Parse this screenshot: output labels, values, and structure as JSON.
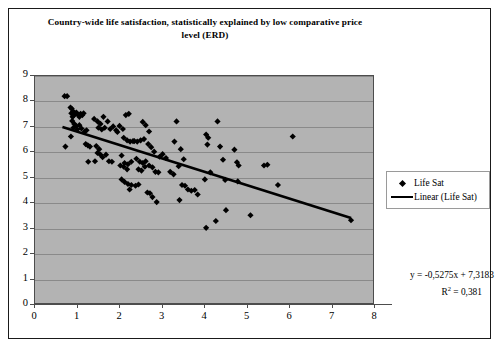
{
  "chart_data": {
    "type": "scatter",
    "title": "Country-wide life satisfaction, statistically explained by low comparative price level (ERD)",
    "xlabel": "",
    "ylabel": "",
    "xlim": [
      0,
      8
    ],
    "ylim": [
      0,
      9
    ],
    "x_ticks": [
      "0",
      "1",
      "2",
      "3",
      "4",
      "5",
      "6",
      "7",
      "8"
    ],
    "y_ticks": [
      "0",
      "1",
      "2",
      "3",
      "4",
      "5",
      "6",
      "7",
      "8",
      "9"
    ],
    "grid": "horizontal",
    "legend_position": "right",
    "plot_background": "#b3b3b3",
    "marker_color": "#000000",
    "trendline_color": "#000000",
    "legend": [
      {
        "label": "Life Sat",
        "key": "diamond-marker"
      },
      {
        "label": "Linear (Life Sat)",
        "key": "line-marker"
      }
    ],
    "annotations": {
      "equation": "y = -0,5275x + 7,3183",
      "r_squared_prefix": "R",
      "r_squared_exponent": "2",
      "r_squared_value": " = 0,381"
    },
    "trendline": {
      "slope": -0.5275,
      "intercept": 7.3183,
      "r_squared": 0.381,
      "x_start": 0.65,
      "x_end": 7.48
    },
    "series": [
      {
        "name": "Life Sat",
        "points": [
          [
            0.7,
            8.2
          ],
          [
            0.76,
            8.2
          ],
          [
            0.72,
            6.2
          ],
          [
            0.84,
            7.75
          ],
          [
            0.87,
            7.7
          ],
          [
            0.9,
            7.6
          ],
          [
            0.86,
            7.52
          ],
          [
            0.92,
            7.45
          ],
          [
            0.89,
            7.38
          ],
          [
            0.95,
            7.5
          ],
          [
            0.98,
            7.55
          ],
          [
            1.02,
            7.46
          ],
          [
            1.05,
            7.38
          ],
          [
            0.88,
            7.22
          ],
          [
            0.93,
            7.1
          ],
          [
            0.97,
            7.02
          ],
          [
            0.91,
            6.95
          ],
          [
            1.0,
            6.88
          ],
          [
            0.85,
            6.6
          ],
          [
            1.08,
            7.5
          ],
          [
            1.12,
            7.45
          ],
          [
            1.15,
            7.52
          ],
          [
            1.05,
            7.05
          ],
          [
            1.1,
            6.92
          ],
          [
            1.18,
            6.8
          ],
          [
            1.22,
            6.85
          ],
          [
            1.2,
            6.3
          ],
          [
            1.25,
            6.25
          ],
          [
            1.3,
            6.2
          ],
          [
            1.26,
            5.6
          ],
          [
            1.42,
            5.62
          ],
          [
            1.4,
            7.3
          ],
          [
            1.48,
            7.2
          ],
          [
            1.55,
            7.1
          ],
          [
            1.62,
            7.38
          ],
          [
            1.5,
            6.95
          ],
          [
            1.58,
            6.88
          ],
          [
            1.65,
            6.95
          ],
          [
            1.72,
            7.2
          ],
          [
            1.45,
            6.22
          ],
          [
            1.52,
            6.1
          ],
          [
            1.48,
            5.95
          ],
          [
            1.55,
            5.88
          ],
          [
            1.6,
            5.78
          ],
          [
            1.68,
            5.88
          ],
          [
            1.75,
            5.62
          ],
          [
            1.82,
            5.6
          ],
          [
            1.78,
            6.9
          ],
          [
            1.85,
            7.0
          ],
          [
            1.92,
            6.85
          ],
          [
            1.95,
            6.78
          ],
          [
            2.0,
            7.02
          ],
          [
            2.08,
            6.9
          ],
          [
            2.15,
            7.45
          ],
          [
            2.22,
            7.5
          ],
          [
            2.1,
            6.55
          ],
          [
            2.18,
            6.45
          ],
          [
            2.25,
            6.4
          ],
          [
            2.32,
            6.42
          ],
          [
            2.05,
            5.85
          ],
          [
            2.12,
            5.55
          ],
          [
            2.2,
            5.5
          ],
          [
            2.28,
            5.6
          ],
          [
            2.02,
            5.45
          ],
          [
            2.1,
            5.4
          ],
          [
            2.18,
            5.3
          ],
          [
            2.05,
            4.9
          ],
          [
            2.12,
            4.8
          ],
          [
            2.2,
            4.72
          ],
          [
            2.28,
            4.68
          ],
          [
            2.24,
            4.5
          ],
          [
            2.38,
            4.65
          ],
          [
            2.45,
            4.7
          ],
          [
            2.35,
            6.42
          ],
          [
            2.42,
            6.4
          ],
          [
            2.5,
            6.45
          ],
          [
            2.58,
            6.5
          ],
          [
            2.4,
            5.72
          ],
          [
            2.48,
            5.6
          ],
          [
            2.55,
            5.55
          ],
          [
            2.62,
            5.62
          ],
          [
            2.45,
            5.3
          ],
          [
            2.52,
            5.25
          ],
          [
            2.6,
            5.4
          ],
          [
            2.55,
            7.18
          ],
          [
            2.62,
            7.05
          ],
          [
            2.7,
            6.8
          ],
          [
            2.68,
            6.3
          ],
          [
            2.75,
            6.18
          ],
          [
            2.82,
            6.0
          ],
          [
            2.7,
            5.45
          ],
          [
            2.78,
            5.38
          ],
          [
            2.85,
            5.2
          ],
          [
            2.92,
            5.18
          ],
          [
            2.66,
            4.38
          ],
          [
            2.72,
            4.35
          ],
          [
            2.78,
            4.2
          ],
          [
            2.88,
            4.0
          ],
          [
            2.95,
            5.8
          ],
          [
            3.02,
            5.9
          ],
          [
            3.1,
            5.75
          ],
          [
            3.2,
            5.2
          ],
          [
            3.28,
            5.1
          ],
          [
            3.35,
            7.2
          ],
          [
            3.3,
            6.4
          ],
          [
            3.45,
            6.1
          ],
          [
            3.52,
            5.7
          ],
          [
            3.4,
            5.42
          ],
          [
            3.48,
            4.68
          ],
          [
            3.55,
            4.65
          ],
          [
            3.42,
            4.08
          ],
          [
            3.62,
            4.5
          ],
          [
            3.7,
            4.45
          ],
          [
            3.78,
            4.48
          ],
          [
            3.85,
            4.3
          ],
          [
            4.05,
            6.68
          ],
          [
            4.1,
            6.55
          ],
          [
            4.08,
            6.28
          ],
          [
            4.02,
            4.9
          ],
          [
            4.15,
            5.18
          ],
          [
            4.05,
            2.98
          ],
          [
            4.28,
            3.25
          ],
          [
            4.32,
            7.2
          ],
          [
            4.38,
            6.2
          ],
          [
            4.45,
            5.68
          ],
          [
            4.5,
            4.88
          ],
          [
            4.52,
            3.68
          ],
          [
            4.72,
            6.08
          ],
          [
            4.78,
            5.58
          ],
          [
            4.82,
            5.45
          ],
          [
            4.8,
            4.82
          ],
          [
            5.1,
            3.48
          ],
          [
            5.42,
            5.45
          ],
          [
            5.5,
            5.48
          ],
          [
            5.75,
            4.68
          ],
          [
            6.1,
            6.6
          ],
          [
            7.48,
            3.28
          ]
        ]
      }
    ]
  }
}
